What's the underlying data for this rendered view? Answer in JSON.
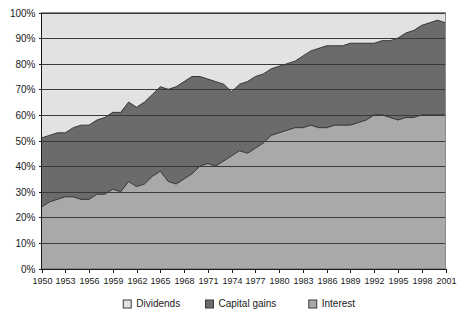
{
  "chart_data": {
    "type": "area",
    "stacked": "100%",
    "title": "",
    "subtitle": "",
    "xlabel": "",
    "ylabel": "",
    "ylim": [
      0,
      100
    ],
    "xlim": [
      1950,
      2001
    ],
    "grid": true,
    "legend_position": "bottom",
    "y_ticks": [
      "0%",
      "10%",
      "20%",
      "30%",
      "40%",
      "50%",
      "60%",
      "70%",
      "80%",
      "90%",
      "100%"
    ],
    "y_tick_values": [
      0,
      10,
      20,
      30,
      40,
      50,
      60,
      70,
      80,
      90,
      100
    ],
    "x_tick_labels": [
      "1950",
      "1953",
      "1956",
      "1959",
      "1962",
      "1965",
      "1968",
      "1971",
      "1974",
      "1977",
      "1980",
      "1983",
      "1986",
      "1989",
      "1992",
      "1995",
      "1998",
      "2001"
    ],
    "x_tick_values": [
      1950,
      1953,
      1956,
      1959,
      1962,
      1965,
      1968,
      1971,
      1974,
      1977,
      1980,
      1983,
      1986,
      1989,
      1992,
      1995,
      1998,
      2001
    ],
    "x": [
      1950,
      1951,
      1952,
      1953,
      1954,
      1955,
      1956,
      1957,
      1958,
      1959,
      1960,
      1961,
      1962,
      1963,
      1964,
      1965,
      1966,
      1967,
      1968,
      1969,
      1970,
      1971,
      1972,
      1973,
      1974,
      1975,
      1976,
      1977,
      1978,
      1979,
      1980,
      1981,
      1982,
      1983,
      1984,
      1985,
      1986,
      1987,
      1988,
      1989,
      1990,
      1991,
      1992,
      1993,
      1994,
      1995,
      1996,
      1997,
      1998,
      1999,
      2000,
      2001
    ],
    "series": [
      {
        "name": "Interest",
        "color": "#a9a9a9",
        "values": [
          24,
          26,
          27,
          28,
          28,
          27,
          27,
          29,
          29,
          31,
          30,
          34,
          32,
          33,
          36,
          38,
          34,
          33,
          35,
          37,
          40,
          41,
          40,
          42,
          44,
          46,
          45,
          47,
          49,
          52,
          53,
          54,
          55,
          55,
          56,
          55,
          55,
          56,
          56,
          56,
          57,
          58,
          60,
          60,
          59,
          58,
          59,
          59,
          60,
          60,
          60,
          60
        ]
      },
      {
        "name": "Capital gains",
        "color": "#6b6b6b",
        "values": [
          27,
          26,
          26,
          25,
          27,
          29,
          29,
          29,
          30,
          30,
          31,
          31,
          31,
          32,
          32,
          33,
          36,
          38,
          38,
          38,
          35,
          33,
          33,
          30,
          25,
          26,
          28,
          28,
          27,
          26,
          26,
          26,
          26,
          28,
          29,
          31,
          32,
          31,
          31,
          32,
          31,
          30,
          28,
          29,
          30,
          32,
          33,
          34,
          35,
          36,
          37,
          36
        ]
      },
      {
        "name": "Dividends",
        "color": "#e2e2e2",
        "values": [
          49,
          48,
          47,
          47,
          45,
          44,
          44,
          42,
          41,
          39,
          39,
          35,
          37,
          35,
          32,
          29,
          30,
          29,
          27,
          25,
          25,
          26,
          27,
          28,
          31,
          28,
          27,
          25,
          24,
          22,
          21,
          20,
          19,
          17,
          15,
          14,
          13,
          13,
          13,
          12,
          12,
          12,
          12,
          11,
          11,
          10,
          8,
          7,
          5,
          4,
          3,
          4
        ]
      }
    ],
    "upper_boundary_note": "top of Capital gains band (Interest + Capital gains cumulative)",
    "cumulative_interest": [
      24,
      26,
      27,
      28,
      28,
      27,
      27,
      29,
      29,
      31,
      30,
      34,
      32,
      33,
      36,
      38,
      34,
      33,
      35,
      37,
      40,
      41,
      40,
      42,
      44,
      46,
      45,
      47,
      49,
      52,
      53,
      54,
      55,
      55,
      56,
      55,
      55,
      56,
      56,
      56,
      57,
      58,
      60,
      60,
      59,
      58,
      59,
      59,
      60,
      60,
      60,
      60
    ],
    "cumulative_capital_gains": [
      51,
      52,
      53,
      53,
      55,
      56,
      56,
      58,
      59,
      61,
      61,
      65,
      63,
      65,
      68,
      71,
      70,
      71,
      73,
      75,
      75,
      74,
      73,
      72,
      69,
      72,
      73,
      75,
      76,
      78,
      79,
      80,
      81,
      83,
      85,
      86,
      87,
      87,
      87,
      88,
      88,
      88,
      88,
      89,
      89,
      90,
      92,
      93,
      95,
      96,
      97,
      96
    ]
  },
  "legend": {
    "items": [
      {
        "label": "Dividends",
        "color": "#e2e2e2"
      },
      {
        "label": "Capital gains",
        "color": "#6b6b6b"
      },
      {
        "label": "Interest",
        "color": "#a9a9a9"
      }
    ]
  },
  "plot": {
    "background": "#e2e2e2",
    "gridline_color": "#3a3a3a",
    "axis_color": "#1a1a1a",
    "border_color": "#8a8a8a"
  }
}
